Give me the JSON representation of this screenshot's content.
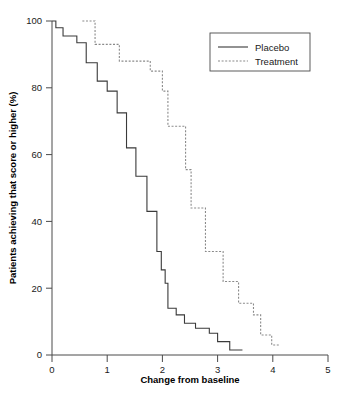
{
  "chart_data": {
    "type": "line",
    "subtype": "step-cumulative-distribution",
    "title": "",
    "xlabel": "Change from baseline",
    "ylabel": "Patients achieving that score or higher (%)",
    "xlim": [
      0,
      5
    ],
    "ylim": [
      0,
      100
    ],
    "xticks": [
      0,
      1,
      2,
      3,
      4,
      5
    ],
    "xtick_labels": [
      "0",
      "1",
      "2",
      "3",
      "4",
      "5"
    ],
    "yticks": [
      0,
      20,
      40,
      60,
      80,
      100
    ],
    "ytick_labels": [
      "0",
      "20",
      "40",
      "60",
      "80",
      "100"
    ],
    "grid": false,
    "legend_position": "top-right",
    "legend_entries": [
      {
        "name": "Placebo",
        "style": "solid",
        "color": "#3a3a3a"
      },
      {
        "name": "Treatment",
        "style": "dashed",
        "color": "#8a8a8a"
      }
    ],
    "series": [
      {
        "name": "Placebo",
        "style": "solid",
        "color": "#3a3a3a",
        "points": [
          [
            0.0,
            100.0
          ],
          [
            0.07,
            98.0
          ],
          [
            0.2,
            95.5
          ],
          [
            0.45,
            93.5
          ],
          [
            0.62,
            87.5
          ],
          [
            0.82,
            82.0
          ],
          [
            1.0,
            79.0
          ],
          [
            1.18,
            72.5
          ],
          [
            1.35,
            62.0
          ],
          [
            1.52,
            53.5
          ],
          [
            1.72,
            43.0
          ],
          [
            1.9,
            31.0
          ],
          [
            1.98,
            25.5
          ],
          [
            2.05,
            21.5
          ],
          [
            2.1,
            14.0
          ],
          [
            2.25,
            12.0
          ],
          [
            2.4,
            9.5
          ],
          [
            2.6,
            8.0
          ],
          [
            2.85,
            6.5
          ],
          [
            3.0,
            4.0
          ],
          [
            3.22,
            1.5
          ],
          [
            3.45,
            1.5
          ]
        ]
      },
      {
        "name": "Treatment",
        "style": "dashed",
        "color": "#8a8a8a",
        "points": [
          [
            0.55,
            100.0
          ],
          [
            0.78,
            93.0
          ],
          [
            1.2,
            93.0
          ],
          [
            1.22,
            88.0
          ],
          [
            1.72,
            88.0
          ],
          [
            1.78,
            85.0
          ],
          [
            2.0,
            79.0
          ],
          [
            2.1,
            68.5
          ],
          [
            2.35,
            68.5
          ],
          [
            2.42,
            55.5
          ],
          [
            2.52,
            44.0
          ],
          [
            2.72,
            44.0
          ],
          [
            2.78,
            31.0
          ],
          [
            3.02,
            31.0
          ],
          [
            3.1,
            22.0
          ],
          [
            3.32,
            22.0
          ],
          [
            3.38,
            15.5
          ],
          [
            3.58,
            15.5
          ],
          [
            3.65,
            12.0
          ],
          [
            3.78,
            6.0
          ],
          [
            3.92,
            6.0
          ],
          [
            3.98,
            3.0
          ],
          [
            4.12,
            3.0
          ]
        ]
      }
    ]
  }
}
